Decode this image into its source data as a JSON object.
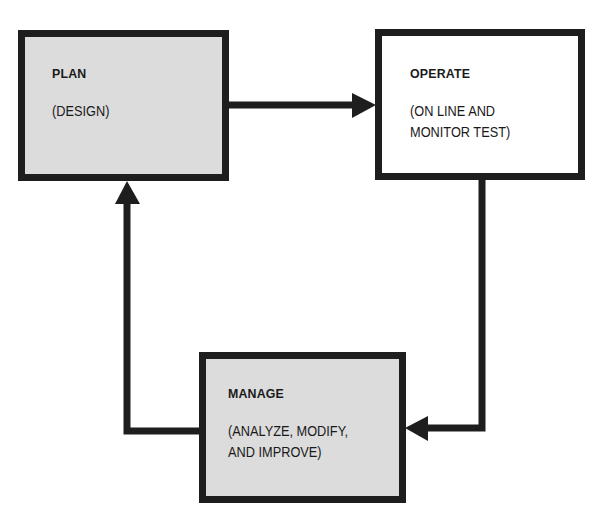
{
  "diagram": {
    "type": "cycle-flowchart",
    "nodes": [
      {
        "id": "plan",
        "title": "PLAN",
        "description_lines": [
          "(DESIGN)"
        ],
        "fill": "#dcdcdc"
      },
      {
        "id": "operate",
        "title": "OPERATE",
        "description_lines": [
          "(ON LINE AND",
          "MONITOR TEST)"
        ],
        "fill": "#ffffff"
      },
      {
        "id": "manage",
        "title": "MANAGE",
        "description_lines": [
          "(ANALYZE, MODIFY,",
          "AND IMPROVE)"
        ],
        "fill": "#dcdcdc"
      }
    ],
    "edges": [
      {
        "from": "plan",
        "to": "operate"
      },
      {
        "from": "operate",
        "to": "manage"
      },
      {
        "from": "manage",
        "to": "plan"
      }
    ],
    "colors": {
      "stroke": "#1e1e1e",
      "shaded_fill": "#dcdcdc",
      "background": "#ffffff"
    }
  }
}
